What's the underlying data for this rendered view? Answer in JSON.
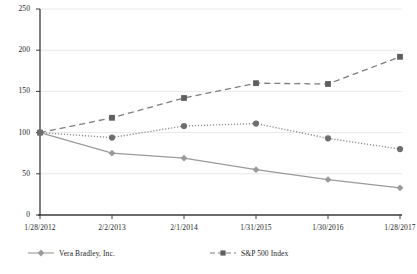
{
  "chart_data": {
    "type": "line",
    "title": "",
    "xlabel": "",
    "ylabel": "",
    "ylim": [
      0,
      250
    ],
    "yticks": [
      0,
      50,
      100,
      150,
      200,
      250
    ],
    "ytick_labels": [
      "0",
      "50",
      "100",
      "150",
      "200",
      "250"
    ],
    "grid": true,
    "grid_axis": "y",
    "legend_position": "bottom",
    "categories": [
      "1/28/2012",
      "2/2/2013",
      "2/1/2014",
      "1/31/2015",
      "1/30/2016",
      "1/28/2017"
    ],
    "series": [
      {
        "name": "Vera Bradley, Inc.",
        "marker": "diamond",
        "linestyle": "solid",
        "color": "#9a9a9a",
        "values": [
          100,
          75,
          69,
          55,
          43,
          33
        ]
      },
      {
        "name": "S&P 500 Index",
        "marker": "square",
        "linestyle": "dashed",
        "color": "#7d7d7d",
        "values": [
          100,
          118,
          142,
          160,
          159,
          192
        ]
      },
      {
        "name": "",
        "marker": "circle",
        "linestyle": "dotted",
        "color": "#8e8e8e",
        "values": [
          100,
          94,
          108,
          111,
          93,
          80
        ]
      }
    ]
  },
  "legend": {
    "entries": [
      {
        "label": "Vera Bradley, Inc."
      },
      {
        "label": "S&P 500 Index"
      }
    ]
  },
  "colors": {
    "axis": "#3a3a3a",
    "gridline": "#e2e2e2",
    "series_vera_bradley": "#9a9a9a",
    "series_sp500": "#7d7d7d",
    "series_peer": "#8e8e8e",
    "background": "#ffffff"
  }
}
